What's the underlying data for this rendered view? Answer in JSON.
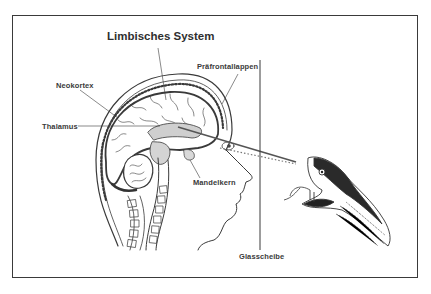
{
  "diagram": {
    "title": "Limbisches System",
    "labels": {
      "neokortex": "Neokortex",
      "thalamus": "Thalamus",
      "praefrontallappen": "Präfrontallappen",
      "mandelkern": "Mandelkern",
      "glasscheibe": "Glasscheibe"
    },
    "elements": [
      "head-sagittal-section",
      "brain",
      "cerebellum",
      "spine",
      "eye",
      "sight-line",
      "glass-pane",
      "snake-head"
    ],
    "colors": {
      "line": "#3a3a3a",
      "limbic_fill": "#c8c8c8",
      "background": "#ffffff"
    }
  }
}
